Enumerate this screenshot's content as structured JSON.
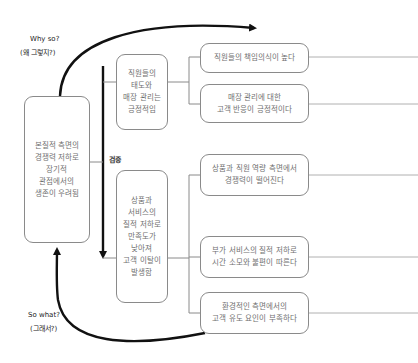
{
  "annotations": {
    "why_so": "Why so?",
    "why_so_ko": "(왜 그렇지?)",
    "so_what": "So what?",
    "so_what_ko": "(그래서?)",
    "verify": "검증"
  },
  "root": {
    "text": "본질적 측면의\n경쟁력 저하로\n장기적\n관점에서의\n생존이 우려됨"
  },
  "branches": [
    {
      "text": "직원들의\n태도와\n매장 관리는\n긍정적임",
      "children": [
        {
          "text": "직원들의 책임의식이 높다"
        },
        {
          "text": "매장 관리에 대한\n고객 반응이 긍정적이다"
        }
      ]
    },
    {
      "text": "상품과\n서비스의\n질적 저하로\n만족도가\n낮아져\n고객 이탈이\n발생함",
      "children": [
        {
          "text": "상품과 직원 역량 측면에서\n경쟁력이 떨어진다"
        },
        {
          "text": "부가 서비스의 질적 저하로\n시간 소모와 불편이 따른다"
        },
        {
          "text": "환경적인 측면에서의\n고객 유도 요인이 부족하다"
        }
      ]
    }
  ],
  "colors": {
    "arrow": "#111111",
    "connector": "#8a8a8a",
    "box_border": "#8a8a8a",
    "text": "#707070"
  }
}
